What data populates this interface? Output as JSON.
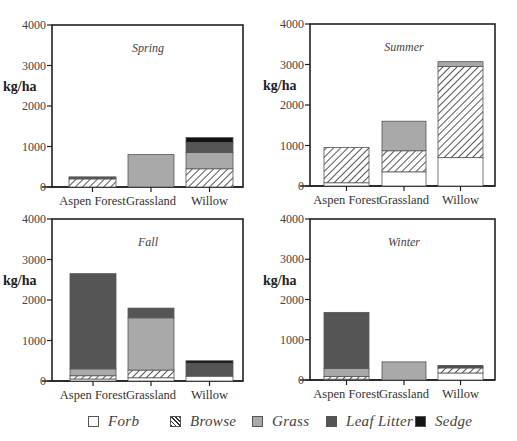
{
  "chart_data": [
    {
      "type": "bar",
      "stacked": true,
      "title": "Spring",
      "xlabel": "",
      "ylabel": "kg/ha",
      "ylim": [
        0,
        4000
      ],
      "yticks": [
        0,
        1000,
        2000,
        3000,
        4000
      ],
      "categories": [
        "Aspen Forest",
        "Grassland",
        "Willow"
      ],
      "series": [
        {
          "name": "Forb",
          "values": [
            0,
            0,
            0
          ]
        },
        {
          "name": "Browse",
          "values": [
            200,
            0,
            450
          ]
        },
        {
          "name": "Grass",
          "values": [
            0,
            800,
            400
          ]
        },
        {
          "name": "Leaf Litter",
          "values": [
            50,
            0,
            250
          ]
        },
        {
          "name": "Sedge",
          "values": [
            0,
            0,
            120
          ]
        }
      ],
      "totals": [
        250,
        800,
        1220
      ],
      "grid": false
    },
    {
      "type": "bar",
      "stacked": true,
      "title": "Summer",
      "xlabel": "",
      "ylabel": "kg/ha",
      "ylim": [
        0,
        4000
      ],
      "yticks": [
        0,
        1000,
        2000,
        3000,
        4000
      ],
      "categories": [
        "Aspen Forest",
        "Grassland",
        "Willow"
      ],
      "series": [
        {
          "name": "Forb",
          "values": [
            80,
            350,
            700
          ]
        },
        {
          "name": "Browse",
          "values": [
            870,
            520,
            2250
          ]
        },
        {
          "name": "Grass",
          "values": [
            0,
            730,
            120
          ]
        },
        {
          "name": "Leaf Litter",
          "values": [
            0,
            0,
            0
          ]
        },
        {
          "name": "Sedge",
          "values": [
            0,
            0,
            0
          ]
        }
      ],
      "totals": [
        950,
        1600,
        3070
      ],
      "grid": false
    },
    {
      "type": "bar",
      "stacked": true,
      "title": "Fall",
      "xlabel": "",
      "ylabel": "kg/ha",
      "ylim": [
        0,
        4000
      ],
      "yticks": [
        0,
        1000,
        2000,
        3000,
        4000
      ],
      "categories": [
        "Aspen Forest",
        "Grassland",
        "Willow"
      ],
      "series": [
        {
          "name": "Forb",
          "values": [
            50,
            80,
            120
          ]
        },
        {
          "name": "Browse",
          "values": [
            80,
            190,
            0
          ]
        },
        {
          "name": "Grass",
          "values": [
            170,
            1290,
            0
          ]
        },
        {
          "name": "Leaf Litter",
          "values": [
            2350,
            240,
            320
          ]
        },
        {
          "name": "Sedge",
          "values": [
            0,
            0,
            60
          ]
        }
      ],
      "totals": [
        2650,
        1800,
        500
      ],
      "grid": false
    },
    {
      "type": "bar",
      "stacked": true,
      "title": "Winter",
      "xlabel": "",
      "ylabel": "kg/ha",
      "ylim": [
        0,
        4000
      ],
      "yticks": [
        0,
        1000,
        2000,
        3000,
        4000
      ],
      "categories": [
        "Aspen Forest",
        "Grassland",
        "Willow"
      ],
      "series": [
        {
          "name": "Forb",
          "values": [
            20,
            0,
            175
          ]
        },
        {
          "name": "Browse",
          "values": [
            70,
            0,
            125
          ]
        },
        {
          "name": "Grass",
          "values": [
            200,
            450,
            0
          ]
        },
        {
          "name": "Leaf Litter",
          "values": [
            1390,
            0,
            30
          ]
        },
        {
          "name": "Sedge",
          "values": [
            0,
            0,
            30
          ]
        }
      ],
      "totals": [
        1680,
        450,
        360
      ],
      "grid": false
    }
  ],
  "legend": {
    "position": "bottom",
    "items": [
      {
        "name": "Forb",
        "fill": "#ffffff",
        "pattern": "none"
      },
      {
        "name": "Browse",
        "fill": "#ffffff",
        "pattern": "diagonal-hatch"
      },
      {
        "name": "Grass",
        "fill": "#a9a9a9",
        "pattern": "none"
      },
      {
        "name": "Leaf Litter",
        "fill": "#555555",
        "pattern": "none"
      },
      {
        "name": "Sedge",
        "fill": "#141414",
        "pattern": "none"
      }
    ]
  },
  "colors": {
    "axis": "#222222",
    "text": "#333333",
    "bar_outline": "#555555"
  }
}
